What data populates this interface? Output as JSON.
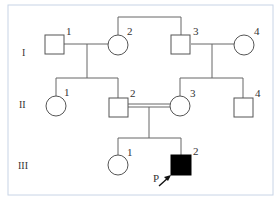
{
  "diagram": {
    "type": "pedigree",
    "generations": [
      {
        "label": "I"
      },
      {
        "label": "II"
      },
      {
        "label": "III"
      }
    ],
    "individuals": {
      "I1": {
        "number": "1",
        "sex": "male",
        "affected": false
      },
      "I2": {
        "number": "2",
        "sex": "female",
        "affected": false
      },
      "I3": {
        "number": "3",
        "sex": "male",
        "affected": false
      },
      "I4": {
        "number": "4",
        "sex": "female",
        "affected": false
      },
      "II1": {
        "number": "1",
        "sex": "female",
        "affected": false
      },
      "II2": {
        "number": "2",
        "sex": "male",
        "affected": false
      },
      "II3": {
        "number": "3",
        "sex": "female",
        "affected": false
      },
      "II4": {
        "number": "4",
        "sex": "male",
        "affected": false
      },
      "III1": {
        "number": "1",
        "sex": "female",
        "affected": false
      },
      "III2": {
        "number": "2",
        "sex": "male",
        "affected": true
      }
    },
    "proband": {
      "label": "P",
      "individual": "III2"
    },
    "colors": {
      "line": "#555555",
      "affected_fill": "#000000",
      "border": "#c8d4e6"
    }
  }
}
